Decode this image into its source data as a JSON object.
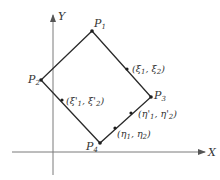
{
  "diagram": {
    "type": "coordinate-quadrilateral",
    "axes": {
      "x": {
        "label": "X",
        "from": [
          12,
          152
        ],
        "to": [
          205,
          152
        ]
      },
      "y": {
        "label": "Y",
        "from": [
          53,
          175
        ],
        "to": [
          53,
          15
        ]
      }
    },
    "vertices": [
      {
        "id": "P1",
        "label": "P",
        "sub": "1",
        "x": 92,
        "y": 31
      },
      {
        "id": "P2",
        "label": "P",
        "sub": "2",
        "x": 41,
        "y": 80
      },
      {
        "id": "P3",
        "label": "P",
        "sub": "3",
        "x": 151,
        "y": 97
      },
      {
        "id": "P4",
        "label": "P",
        "sub": "4",
        "x": 100,
        "y": 143
      }
    ],
    "edges": [
      [
        "P1",
        "P2"
      ],
      [
        "P2",
        "P4"
      ],
      [
        "P4",
        "P3"
      ],
      [
        "P3",
        "P1"
      ]
    ],
    "marked_points": [
      {
        "id": "xi",
        "label": "(ξ1, ξ2)",
        "x": 127,
        "y": 69,
        "edge": "P1-P3"
      },
      {
        "id": "xi_prime",
        "label": "(ξ'1, ξ'2)",
        "x": 62,
        "y": 100,
        "edge": "P2-P4"
      },
      {
        "id": "eta_prime",
        "label": "(η'1, η'2)",
        "x": 131,
        "y": 113,
        "edge": "P4-P3"
      },
      {
        "id": "eta",
        "label": "(η1, η2)",
        "x": 115,
        "y": 128,
        "edge": "P4-P3"
      }
    ],
    "colors": {
      "axis": "#7a7a7a",
      "edge": "#2a2a2a",
      "text": "#333333"
    }
  },
  "labels": {
    "x_axis": "X",
    "y_axis": "Y",
    "P": "P",
    "p1_sub": "1",
    "p2_sub": "2",
    "p3_sub": "3",
    "p4_sub": "4",
    "xi_open": "(ξ",
    "xi_sub1": "1",
    "xi_mid": ", ξ",
    "xi_sub2": "2",
    "xi_close": ")",
    "xip_open": "(ξ'",
    "xip_sub1": "1",
    "xip_mid": ", ξ'",
    "xip_sub2": "2",
    "xip_close": ")",
    "etap_open": "(η'",
    "etap_sub1": "1",
    "etap_mid": ", η'",
    "etap_sub2": "2",
    "etap_close": ")",
    "eta_open": "(η",
    "eta_sub1": "1",
    "eta_mid": ", η",
    "eta_sub2": "2",
    "eta_close": ")"
  }
}
